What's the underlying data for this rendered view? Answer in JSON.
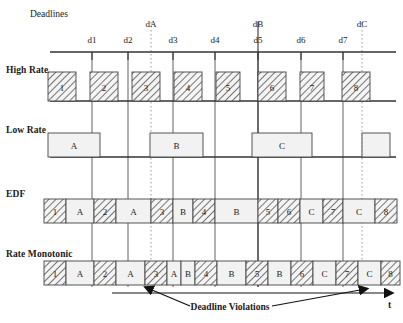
{
  "figure": {
    "deadlines_title": "Deadlines",
    "time_axis_label": "t",
    "violations_label": "Deadline Violations"
  },
  "row_labels": {
    "high_rate": "High Rate",
    "low_rate": "Low Rate",
    "edf": "EDF",
    "rate_monotonic": "Rate Monotonic"
  },
  "deadline_ticks": [
    {
      "label": "d1",
      "x": 92
    },
    {
      "label": "d2",
      "x": 128
    },
    {
      "label": "d3",
      "x": 173
    },
    {
      "label": "d4",
      "x": 215
    },
    {
      "label": "d5",
      "x": 258
    },
    {
      "label": "d6",
      "x": 301
    },
    {
      "label": "d7",
      "x": 343
    }
  ],
  "task_deadlines": [
    {
      "label": "dA",
      "x": 151,
      "dotted": true
    },
    {
      "label": "dB",
      "x": 258,
      "dotted": false
    },
    {
      "label": "dC",
      "x": 362,
      "dotted": true
    }
  ],
  "high_rate_blocks": [
    {
      "label": "1",
      "x": 48,
      "w": 28
    },
    {
      "label": "2",
      "x": 90,
      "w": 28
    },
    {
      "label": "3",
      "x": 132,
      "w": 28
    },
    {
      "label": "4",
      "x": 174,
      "w": 28
    },
    {
      "label": "5",
      "x": 216,
      "w": 24
    },
    {
      "label": "6",
      "x": 258,
      "w": 28
    },
    {
      "label": "7",
      "x": 300,
      "w": 24
    },
    {
      "label": "8",
      "x": 342,
      "w": 28
    }
  ],
  "low_rate_blocks": [
    {
      "label": "A",
      "x": 48,
      "w": 52
    },
    {
      "label": "B",
      "x": 150,
      "w": 53
    },
    {
      "label": "C",
      "x": 252,
      "w": 60
    },
    {
      "label": "",
      "x": 362,
      "w": 28
    }
  ],
  "edf_blocks": [
    {
      "label": "1",
      "x": 44,
      "w": 22,
      "hatched": true
    },
    {
      "label": "A",
      "x": 66,
      "w": 28,
      "hatched": false
    },
    {
      "label": "2",
      "x": 94,
      "w": 22,
      "hatched": true
    },
    {
      "label": "A",
      "x": 116,
      "w": 35,
      "hatched": false
    },
    {
      "label": "3",
      "x": 151,
      "w": 22,
      "hatched": true
    },
    {
      "label": "B",
      "x": 173,
      "w": 20,
      "hatched": false
    },
    {
      "label": "4",
      "x": 193,
      "w": 22,
      "hatched": true
    },
    {
      "label": "B",
      "x": 215,
      "w": 43,
      "hatched": false
    },
    {
      "label": "5",
      "x": 258,
      "w": 20,
      "hatched": true
    },
    {
      "label": "6",
      "x": 278,
      "w": 22,
      "hatched": true
    },
    {
      "label": "C",
      "x": 300,
      "w": 23,
      "hatched": false
    },
    {
      "label": "7",
      "x": 323,
      "w": 20,
      "hatched": true
    },
    {
      "label": "C",
      "x": 343,
      "w": 32,
      "hatched": false
    },
    {
      "label": "8",
      "x": 375,
      "w": 22,
      "hatched": true
    }
  ],
  "rate_monotonic_blocks": [
    {
      "label": "1",
      "x": 44,
      "w": 22,
      "hatched": true
    },
    {
      "label": "A",
      "x": 66,
      "w": 28,
      "hatched": false
    },
    {
      "label": "2",
      "x": 94,
      "w": 22,
      "hatched": true
    },
    {
      "label": "A",
      "x": 116,
      "w": 29,
      "hatched": false
    },
    {
      "label": "3",
      "x": 145,
      "w": 22,
      "hatched": true
    },
    {
      "label": "A",
      "x": 167,
      "w": 14,
      "hatched": false
    },
    {
      "label": "B",
      "x": 181,
      "w": 14,
      "hatched": false
    },
    {
      "label": "4",
      "x": 195,
      "w": 22,
      "hatched": true
    },
    {
      "label": "B",
      "x": 217,
      "w": 29,
      "hatched": false
    },
    {
      "label": "5",
      "x": 246,
      "w": 22,
      "hatched": true
    },
    {
      "label": "B",
      "x": 268,
      "w": 23,
      "hatched": false
    },
    {
      "label": "6",
      "x": 291,
      "w": 22,
      "hatched": true
    },
    {
      "label": "C",
      "x": 313,
      "w": 23,
      "hatched": false
    },
    {
      "label": "7",
      "x": 336,
      "w": 22,
      "hatched": true
    },
    {
      "label": "C",
      "x": 358,
      "w": 23,
      "hatched": false
    },
    {
      "label": "8",
      "x": 381,
      "w": 19,
      "hatched": true
    }
  ],
  "colors": {
    "line": "#333333",
    "block_fill": "#f2f2f2",
    "block_stroke": "#444444",
    "hatch": "#555555",
    "dotted": "#999999",
    "text": "#1a1a1a"
  }
}
